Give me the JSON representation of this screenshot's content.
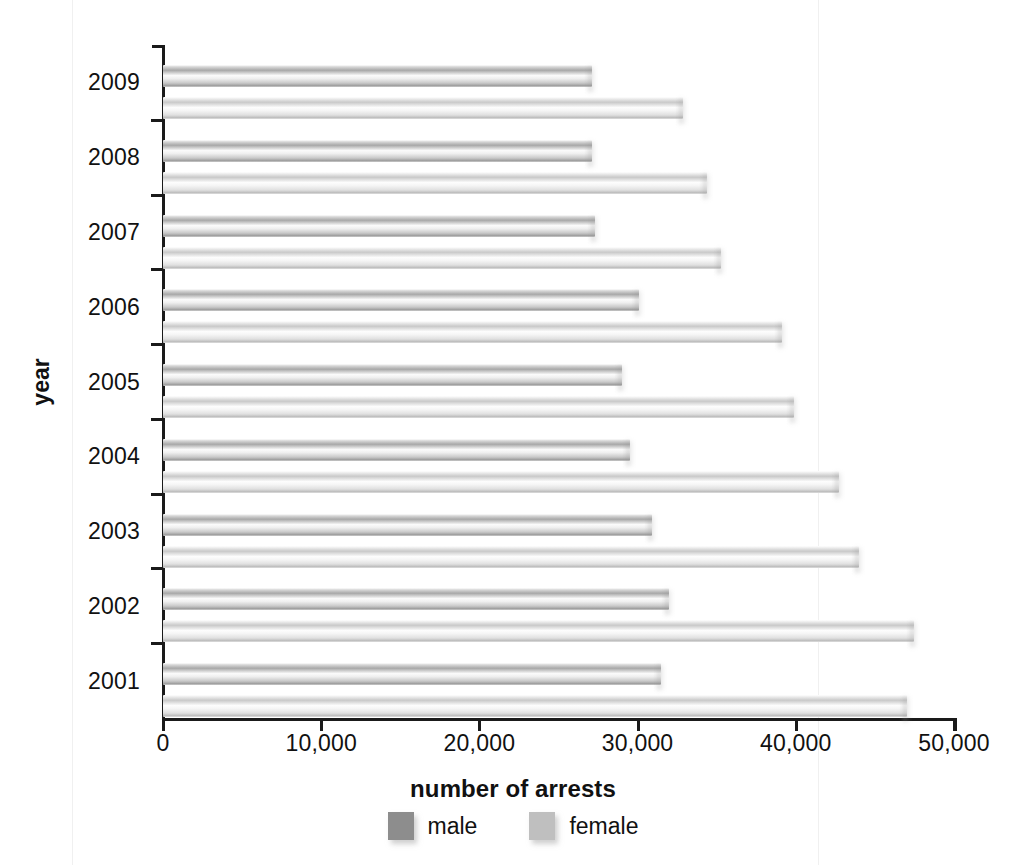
{
  "chart_data": {
    "type": "bar",
    "orientation": "horizontal",
    "title": "",
    "xlabel": "number of arrests",
    "ylabel": "year",
    "categories": [
      "2009",
      "2008",
      "2007",
      "2006",
      "2005",
      "2004",
      "2003",
      "2002",
      "2001"
    ],
    "xlim": [
      0,
      50000
    ],
    "xticks": [
      "0",
      "10,000",
      "20,000",
      "30,000",
      "40,000",
      "50,000"
    ],
    "xtick_values": [
      0,
      10000,
      20000,
      30000,
      40000,
      50000
    ],
    "grid": false,
    "legend_position": "bottom",
    "series": [
      {
        "name": "male",
        "color": "#8d8d8d",
        "values": [
          27100,
          27100,
          27300,
          30100,
          29000,
          29500,
          30900,
          32000,
          31500
        ]
      },
      {
        "name": "female",
        "color": "#bfbfbf",
        "values": [
          32900,
          34400,
          35300,
          39100,
          39900,
          42700,
          44000,
          47500,
          47000
        ]
      }
    ]
  },
  "legend": {
    "items": [
      {
        "label": "male",
        "swatch": "male-swatch"
      },
      {
        "label": "female",
        "swatch": "female-swatch"
      }
    ]
  }
}
